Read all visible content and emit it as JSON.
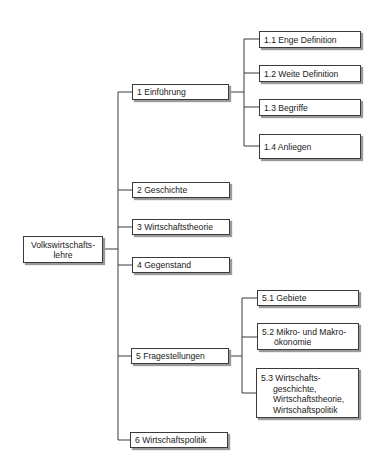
{
  "root": {
    "line1": "Volkswirtschafts-",
    "line2": "lehre"
  },
  "chapters": [
    {
      "label": "1 Einführung"
    },
    {
      "label": "2 Geschichte"
    },
    {
      "label": "3 Wirtschaftstheorie"
    },
    {
      "label": "4 Gegenstand"
    },
    {
      "label": "5 Fragestellungen"
    },
    {
      "label": "6 Wirtschaftspolitik"
    }
  ],
  "sub1": [
    {
      "label": "1.1 Enge Definition"
    },
    {
      "label": "1.2 Weite Definition"
    },
    {
      "label": "1.3 Begriffe"
    },
    {
      "label": "1.4 Anliegen"
    }
  ],
  "sub5": [
    {
      "label": "5.1 Gebiete"
    },
    {
      "line1": "5.2 Mikro- und Makro-",
      "line2": "ökonomie"
    },
    {
      "line1": "5.3 Wirtschafts-",
      "line2": "geschichte,",
      "line3": "Wirtschaftstheorie,",
      "line4": "Wirtschaftspolitik"
    }
  ],
  "colors": {
    "line": "#3a3a3a",
    "shadow": "#9a9a9a",
    "box_bg": "#ffffff"
  }
}
